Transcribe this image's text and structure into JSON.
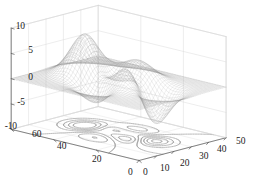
{
  "chart_data": {
    "type": "surface",
    "render": "mesh-wireframe-3d-with-contour-projection",
    "title": "",
    "xlabel": "",
    "ylabel": "",
    "zlabel": "",
    "grid": true,
    "legend": null,
    "function": "peaks",
    "x_axis": {
      "ticks": [
        "0",
        "10",
        "20",
        "30",
        "40",
        "50"
      ],
      "values": [
        0,
        10,
        20,
        30,
        40,
        50
      ],
      "lim": [
        0,
        50
      ]
    },
    "y_axis": {
      "ticks": [
        "0",
        "20",
        "40",
        "60"
      ],
      "values": [
        0,
        20,
        40,
        60
      ],
      "lim": [
        0,
        60
      ]
    },
    "z_axis": {
      "ticks": [
        "10",
        "5",
        "0",
        "-5",
        "-10"
      ],
      "values": [
        10,
        5,
        0,
        -5,
        -10
      ],
      "lim": [
        -10,
        10
      ]
    },
    "surface_peaks": [
      {
        "label": "major-peak",
        "x": 17,
        "y": 38,
        "z": 8.1
      },
      {
        "label": "secondary-peak",
        "x": 33,
        "y": 30,
        "z": 3.5
      },
      {
        "label": "minor-ridge",
        "x": 8,
        "y": 22,
        "z": 3.3
      },
      {
        "label": "deep-valley",
        "x": 31,
        "y": 12,
        "z": -6.5
      },
      {
        "label": "shallow-dip",
        "x": 14,
        "y": 16,
        "z": -3.3
      }
    ],
    "contour_levels": [
      -6,
      -4.5,
      -3,
      -1.5,
      0,
      1.5,
      3,
      4.5,
      6
    ],
    "mesh_lines_u": 49,
    "mesh_lines_v": 49,
    "colors": {
      "background": "#ffffff",
      "mesh": "#8c8c8c",
      "mesh_dark": "#4a4a4a",
      "grid": "#d9d9d9",
      "axis": "#555555",
      "contour": "#999999",
      "tick_text": "#1a1a1a"
    }
  },
  "axis_labels": {
    "z": [
      {
        "text": "10",
        "left": 25,
        "top": 22,
        "align": "right"
      },
      {
        "text": "5",
        "left": 33,
        "top": 46,
        "align": "right"
      },
      {
        "text": "0",
        "left": 33,
        "top": 73,
        "align": "right"
      },
      {
        "text": "-5",
        "left": 25,
        "top": 98,
        "align": "right"
      },
      {
        "text": "-10",
        "left": 17,
        "top": 122,
        "align": "right"
      }
    ],
    "y": [
      {
        "text": "60",
        "left": 32,
        "top": 130
      },
      {
        "text": "40",
        "left": 57,
        "top": 142
      },
      {
        "text": "20",
        "left": 92,
        "top": 155
      },
      {
        "text": "0",
        "left": 128,
        "top": 168
      }
    ],
    "x": [
      {
        "text": "0",
        "left": 143,
        "top": 168
      },
      {
        "text": "10",
        "left": 160,
        "top": 164
      },
      {
        "text": "20",
        "left": 180,
        "top": 159
      },
      {
        "text": "30",
        "left": 199,
        "top": 152
      },
      {
        "text": "40",
        "left": 217,
        "top": 145
      },
      {
        "text": "50",
        "left": 236,
        "top": 137
      }
    ]
  }
}
